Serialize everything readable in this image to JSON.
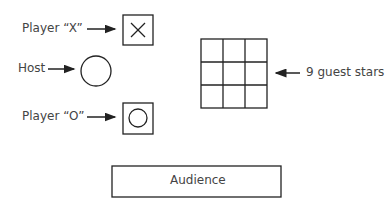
{
  "labels": {
    "player_x": "Player “X”",
    "host": "Host",
    "player_o": "Player “O”",
    "guest_stars": "9 guest stars",
    "audience": "Audience"
  },
  "grid": {
    "rows": 3,
    "cols": 3
  },
  "colors": {
    "stroke": "#222222",
    "text": "#444444",
    "background": "#ffffff"
  }
}
